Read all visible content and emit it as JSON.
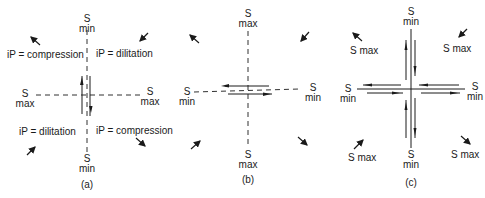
{
  "figure": {
    "panels": [
      {
        "id": "a",
        "caption": "(a)",
        "axes": {
          "top": {
            "s": "S",
            "sub": "min"
          },
          "bottom": {
            "s": "S",
            "sub": "min"
          },
          "left": {
            "s": "S",
            "sub": "max"
          },
          "right": {
            "s": "S",
            "sub": "max"
          }
        },
        "quadrant_labels": {
          "upper_left": "iP = compression",
          "upper_right": "iP = dilitation",
          "lower_left": "iP = dilitation",
          "lower_right": "iP = compression"
        },
        "fault_orientation": "vertical"
      },
      {
        "id": "b",
        "caption": "(b)",
        "axes": {
          "top": {
            "s": "S",
            "sub": "max"
          },
          "bottom": {
            "s": "S",
            "sub": "max"
          },
          "left": {
            "s": "S",
            "sub": "min"
          },
          "right": {
            "s": "S",
            "sub": "min"
          }
        },
        "fault_orientation": "horizontal"
      },
      {
        "id": "c",
        "caption": "(c)",
        "axes": {
          "top": {
            "s": "S",
            "sub": "min"
          },
          "bottom": {
            "s": "S",
            "sub": "min"
          },
          "left": {
            "s": "S",
            "sub": "min"
          },
          "right": {
            "s": "S",
            "sub": "min"
          }
        },
        "quadrant_labels": {
          "upper_left": "S max",
          "upper_right": "S max",
          "lower_left": "S max",
          "lower_right": "S max"
        },
        "fault_orientation": "cross"
      }
    ]
  }
}
